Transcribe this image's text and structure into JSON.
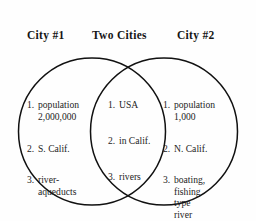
{
  "diagram": {
    "headers": {
      "left": "City #1",
      "center": "Two Cities",
      "right": "City #2"
    },
    "colors": {
      "background": "#fefefe",
      "stroke": "#111111",
      "text": "#1d1d1d"
    },
    "regions": {
      "left": {
        "name": "City #1 only",
        "items": [
          {
            "num": "1.",
            "text": "population\n2,000,000"
          },
          {
            "num": "2.",
            "text": "S. Calif."
          },
          {
            "num": "3.",
            "text": "river-\naqueducts"
          }
        ]
      },
      "center": {
        "name": "Both cities (overlap)",
        "items": [
          {
            "num": "1.",
            "text": "USA"
          },
          {
            "num": "2.",
            "text": "in Calif."
          },
          {
            "num": "3.",
            "text": "rivers"
          }
        ]
      },
      "right": {
        "name": "City #2 only",
        "items": [
          {
            "num": "1.",
            "text": "population\n1,000"
          },
          {
            "num": "2.",
            "text": "N. Calif."
          },
          {
            "num": "3.",
            "text": "boating,\nfishing\ntype\nriver"
          }
        ]
      }
    },
    "geometry": {
      "left_circle": {
        "cx": 92,
        "cy": 131.5,
        "r": 73.5
      },
      "right_circle": {
        "cx": 164,
        "cy": 131.5,
        "r": 73.5
      }
    }
  }
}
